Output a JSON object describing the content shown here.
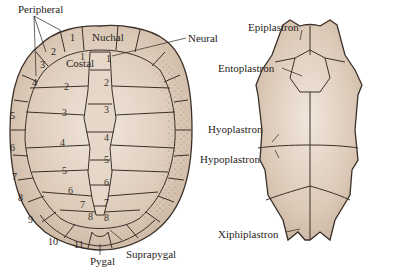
{
  "figure": {
    "carapace": {
      "view": "dorsal",
      "labels": {
        "peripheral": "Peripheral",
        "nuchal": "Nuchal",
        "neural": "Neural",
        "costal": "Costal",
        "suprapygal": "Suprapygal",
        "pygal": "Pygal"
      },
      "peripheral_numbers": [
        "1",
        "2",
        "3",
        "4",
        "5",
        "6",
        "7",
        "8",
        "9",
        "10",
        "11"
      ],
      "costal_numbers": [
        "1",
        "2",
        "3",
        "4",
        "5",
        "6",
        "7",
        "8"
      ],
      "neural_numbers": [
        "1",
        "2",
        "3",
        "4",
        "5",
        "6",
        "7",
        "8"
      ]
    },
    "plastron": {
      "view": "ventral",
      "labels": {
        "epiplastron": "Epiplastron",
        "entoplastron": "Entoplastron",
        "hyoplastron": "Hyoplastron",
        "hypoplastron": "Hypoplastron",
        "xiphiplastron": "Xiphiplastron"
      }
    },
    "colors": {
      "bone": "#dccab8",
      "bone_light": "#efe4d8",
      "suture": "#3b3029",
      "stipple": "#8a7a6c"
    }
  }
}
